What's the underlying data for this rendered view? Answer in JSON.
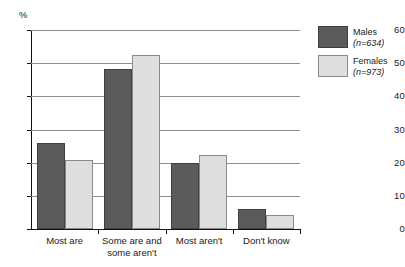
{
  "chart_data": {
    "type": "bar",
    "title": "",
    "xlabel": "",
    "ylabel": "%",
    "ylim": [
      0,
      60
    ],
    "yticks": [
      0,
      10,
      20,
      30,
      40,
      50,
      60
    ],
    "ytick_labels": [
      "0",
      "10",
      "20",
      "30",
      "40",
      "50",
      "60"
    ],
    "grid": true,
    "legend_position": "right",
    "categories": [
      "Most are",
      "Some are and some aren't",
      "Most aren't",
      "Don't know"
    ],
    "category_lines": [
      [
        "Most are"
      ],
      [
        "Some are and",
        "some aren't"
      ],
      [
        "Most aren't"
      ],
      [
        "Don't know"
      ]
    ],
    "series": [
      {
        "name": "Males",
        "n_label": "(n=634)",
        "color": "#5b5b5b",
        "values": [
          26.0,
          48.2,
          20.0,
          6.0
        ]
      },
      {
        "name": "Females",
        "n_label": "(n=973)",
        "color": "#dedede",
        "values": [
          20.8,
          52.5,
          22.3,
          4.2
        ]
      }
    ]
  },
  "legend": {
    "items": [
      {
        "label": "Males",
        "n": "(n=634)"
      },
      {
        "label": "Females",
        "n": "(n=973)"
      }
    ]
  },
  "axis": {
    "unit_label": "%"
  }
}
